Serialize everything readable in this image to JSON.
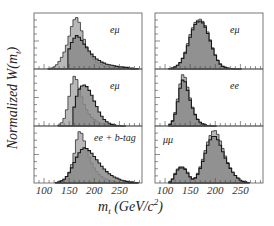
{
  "figure": {
    "ylabel": "Normalized W(m",
    "ylabel_sub": "t",
    "ylabel_close": ")",
    "xlabel_main": "m",
    "xlabel_sub": "t",
    "xlabel_unit": " (GeV/c",
    "xlabel_sup": "2",
    "xlabel_close": ")"
  },
  "chart_data": {
    "type": "bar",
    "title": "",
    "xlabel": "m_t (GeV/c^2)",
    "ylabel": "Normalized W(m_t)",
    "layout": {
      "rows": 3,
      "cols": 2,
      "grid": false,
      "legend": "none"
    },
    "colors": {
      "light_fill": "#b8b8b8",
      "dark_fill": "#8a8a8a",
      "outline": "#1a1a1a",
      "frame": "#555555"
    },
    "xlim": [
      80,
      295
    ],
    "xticks": [
      100,
      150,
      200,
      250
    ],
    "panels": [
      {
        "label": "eμ",
        "row": 0,
        "col": 0,
        "bin_centers": [
          110,
          115,
          120,
          125,
          130,
          135,
          140,
          145,
          150,
          155,
          160,
          165,
          170,
          175,
          180,
          185,
          190,
          195,
          200,
          205,
          210,
          215,
          220,
          225,
          230,
          235,
          240,
          245,
          250,
          255,
          260,
          265,
          270,
          275,
          280,
          285
        ],
        "series": [
          {
            "name": "light",
            "values": [
              0.01,
              0.02,
              0.04,
              0.08,
              0.14,
              0.22,
              0.32,
              0.45,
              0.62,
              0.8,
              0.93,
              0.97,
              0.88,
              0.72,
              0.56,
              0.42,
              0.32,
              0.24,
              0.18,
              0.13,
              0.1,
              0.08,
              0.06,
              0.05,
              0.04,
              0.03,
              0.03,
              0.02,
              0.02,
              0.01,
              0.01,
              0.01,
              0.01,
              0,
              0,
              0
            ]
          },
          {
            "name": "dark",
            "values": [
              0,
              0,
              0,
              0,
              0,
              0,
              0,
              0,
              0.38,
              0.5,
              0.58,
              0.63,
              0.6,
              0.54,
              0.47,
              0.4,
              0.34,
              0.28,
              0.23,
              0.19,
              0.16,
              0.13,
              0.11,
              0.09,
              0.08,
              0.07,
              0.06,
              0.05,
              0.04,
              0.04,
              0.03,
              0.03,
              0.02,
              0.02,
              0.01,
              0.01
            ]
          }
        ]
      },
      {
        "label": "eμ",
        "row": 0,
        "col": 1,
        "bin_centers": [
          110,
          115,
          120,
          125,
          130,
          135,
          140,
          145,
          150,
          155,
          160,
          165,
          170,
          175,
          180,
          185,
          190,
          195,
          200,
          205,
          210,
          215,
          220,
          225,
          230,
          235,
          240,
          245,
          250
        ],
        "series": [
          {
            "name": "light",
            "values": [
              0.01,
              0.02,
              0.04,
              0.07,
              0.12,
              0.2,
              0.32,
              0.48,
              0.65,
              0.78,
              0.88,
              0.92,
              0.94,
              0.9,
              0.82,
              0.7,
              0.55,
              0.4,
              0.27,
              0.17,
              0.1,
              0.05,
              0.03,
              0.02,
              0.01,
              0.01,
              0,
              0,
              0
            ]
          },
          {
            "name": "dark",
            "values": [
              0.01,
              0.02,
              0.04,
              0.07,
              0.12,
              0.2,
              0.3,
              0.44,
              0.6,
              0.74,
              0.84,
              0.89,
              0.9,
              0.87,
              0.79,
              0.67,
              0.53,
              0.38,
              0.26,
              0.16,
              0.09,
              0.05,
              0.03,
              0.02,
              0.01,
              0.01,
              0,
              0,
              0
            ]
          }
        ]
      },
      {
        "label": "eμ",
        "row": 1,
        "col": 0,
        "bin_centers": [
          130,
          135,
          140,
          145,
          150,
          155,
          160,
          165,
          170,
          175,
          180,
          185,
          190,
          195,
          200,
          205,
          210,
          215,
          220,
          225,
          230,
          235,
          240,
          245,
          250,
          255,
          260
        ],
        "series": [
          {
            "name": "light",
            "values": [
              0.02,
              0.06,
              0.14,
              0.3,
              0.55,
              0.78,
              0.92,
              0.86,
              0.7,
              0.54,
              0.4,
              0.3,
              0.22,
              0.16,
              0.12,
              0.09,
              0.06,
              0.05,
              0.04,
              0.03,
              0.02,
              0.02,
              0.01,
              0.01,
              0.01,
              0,
              0
            ]
          },
          {
            "name": "dark",
            "values": [
              0,
              0,
              0,
              0,
              0,
              0,
              0.35,
              0.55,
              0.68,
              0.74,
              0.76,
              0.73,
              0.66,
              0.57,
              0.46,
              0.36,
              0.26,
              0.18,
              0.12,
              0.08,
              0.05,
              0.03,
              0.02,
              0.01,
              0.01,
              0,
              0
            ]
          }
        ]
      },
      {
        "label": "ee",
        "row": 1,
        "col": 1,
        "bin_centers": [
          110,
          115,
          120,
          125,
          130,
          135,
          140,
          145,
          150,
          155,
          160,
          165,
          170,
          175,
          180,
          185,
          190,
          195,
          200
        ],
        "series": [
          {
            "name": "light",
            "values": [
              0.03,
              0.1,
              0.25,
              0.5,
              0.78,
              0.95,
              0.9,
              0.72,
              0.52,
              0.35,
              0.22,
              0.13,
              0.07,
              0.04,
              0.02,
              0.01,
              0.01,
              0,
              0
            ]
          },
          {
            "name": "dark",
            "values": [
              0.03,
              0.09,
              0.22,
              0.45,
              0.7,
              0.85,
              0.82,
              0.66,
              0.48,
              0.33,
              0.21,
              0.12,
              0.07,
              0.04,
              0.02,
              0.01,
              0.01,
              0,
              0
            ]
          }
        ]
      },
      {
        "label": "ee + b-tag",
        "row": 2,
        "col": 0,
        "bin_centers": [
          125,
          130,
          135,
          140,
          145,
          150,
          155,
          160,
          165,
          170,
          175,
          180,
          185,
          190,
          195,
          200,
          205,
          210,
          215,
          220,
          225,
          230,
          235,
          240,
          245,
          250,
          255,
          260,
          265,
          270,
          275,
          280,
          285
        ],
        "series": [
          {
            "name": "light",
            "values": [
              0.01,
              0.02,
              0.04,
              0.07,
              0.12,
              0.2,
              0.34,
              0.55,
              0.8,
              0.95,
              0.92,
              0.78,
              0.62,
              0.48,
              0.37,
              0.28,
              0.21,
              0.16,
              0.12,
              0.09,
              0.07,
              0.05,
              0.04,
              0.03,
              0.02,
              0.02,
              0.01,
              0.01,
              0.01,
              0,
              0,
              0,
              0
            ]
          },
          {
            "name": "dark",
            "values": [
              0.01,
              0.02,
              0.04,
              0.07,
              0.12,
              0.19,
              0.28,
              0.38,
              0.48,
              0.56,
              0.62,
              0.65,
              0.64,
              0.6,
              0.55,
              0.49,
              0.43,
              0.37,
              0.31,
              0.26,
              0.21,
              0.17,
              0.14,
              0.11,
              0.09,
              0.07,
              0.05,
              0.04,
              0.03,
              0.02,
              0.02,
              0.01,
              0.01
            ]
          }
        ]
      },
      {
        "label": "μμ",
        "row": 2,
        "col": 1,
        "bin_centers": [
          110,
          115,
          120,
          125,
          130,
          135,
          140,
          145,
          150,
          155,
          160,
          165,
          170,
          175,
          180,
          185,
          190,
          195,
          200,
          205,
          210,
          215,
          220,
          225,
          230,
          235,
          240,
          245,
          250,
          255,
          260,
          265
        ],
        "series": [
          {
            "name": "light",
            "values": [
              0.02,
              0.08,
              0.18,
              0.26,
              0.3,
              0.3,
              0.27,
              0.2,
              0.12,
              0.08,
              0.1,
              0.18,
              0.3,
              0.44,
              0.6,
              0.76,
              0.88,
              0.96,
              0.97,
              0.9,
              0.78,
              0.64,
              0.5,
              0.38,
              0.28,
              0.2,
              0.14,
              0.09,
              0.05,
              0.03,
              0.02,
              0.01
            ]
          },
          {
            "name": "dark",
            "values": [
              0.02,
              0.07,
              0.16,
              0.24,
              0.28,
              0.28,
              0.25,
              0.18,
              0.11,
              0.07,
              0.09,
              0.16,
              0.27,
              0.4,
              0.55,
              0.7,
              0.8,
              0.86,
              0.86,
              0.8,
              0.7,
              0.58,
              0.46,
              0.36,
              0.27,
              0.2,
              0.14,
              0.09,
              0.05,
              0.03,
              0.02,
              0.01
            ]
          }
        ]
      }
    ]
  }
}
